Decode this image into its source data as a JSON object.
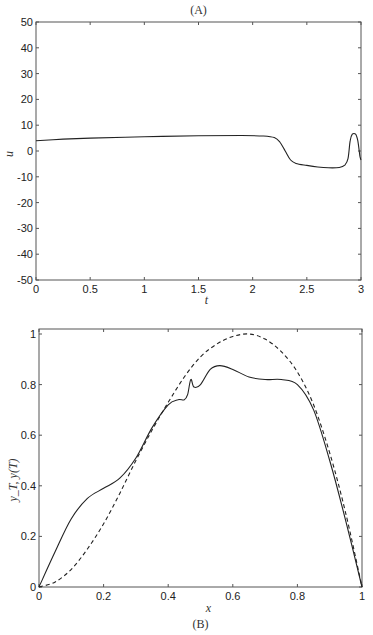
{
  "chart_data": [
    {
      "panel": "A",
      "type": "line",
      "title": "(A)",
      "xlabel": "t",
      "ylabel": "u",
      "xlim": [
        0,
        3
      ],
      "ylim": [
        -50,
        50
      ],
      "xticks": [
        0,
        0.5,
        1,
        1.5,
        2,
        2.5,
        3
      ],
      "xtick_labels": [
        "0",
        "0.5",
        "1",
        "1.5",
        "2",
        "2.5",
        "3"
      ],
      "yticks": [
        -50,
        -40,
        -30,
        -20,
        -10,
        0,
        10,
        20,
        30,
        40,
        50
      ],
      "ytick_labels": [
        "-50",
        "-40",
        "-30",
        "-20",
        "-10",
        "0",
        "10",
        "20",
        "30",
        "40",
        "50"
      ],
      "grid": false,
      "series": [
        {
          "name": "u(t)",
          "style": "solid",
          "x": [
            0,
            0.25,
            0.5,
            1.0,
            1.5,
            1.9,
            2.1,
            2.2,
            2.25,
            2.3,
            2.35,
            2.4,
            2.5,
            2.6,
            2.7,
            2.8,
            2.85,
            2.88,
            2.9,
            2.92,
            2.95,
            2.97,
            2.99,
            3.0
          ],
          "values": [
            4,
            4.6,
            5.0,
            5.5,
            5.9,
            6.0,
            5.8,
            5.2,
            3.5,
            0,
            -3.5,
            -4.8,
            -5.6,
            -6.2,
            -6.5,
            -6.4,
            -5.5,
            -3,
            4,
            6.5,
            6.5,
            4,
            -2,
            -3.5
          ]
        }
      ]
    },
    {
      "panel": "B",
      "type": "line",
      "title": "(B)",
      "xlabel": "x",
      "ylabel": "y_T, y(T)",
      "xlim": [
        0,
        1
      ],
      "ylim": [
        0,
        1
      ],
      "xticks": [
        0,
        0.2,
        0.4,
        0.6,
        0.8,
        1
      ],
      "xtick_labels": [
        "0",
        "0.2",
        "0.4",
        "0.6",
        "0.8",
        "1"
      ],
      "yticks": [
        0,
        0.2,
        0.4,
        0.6,
        0.8,
        1
      ],
      "ytick_labels": [
        "0",
        "0.2",
        "0.4",
        "0.6",
        "0.8",
        "1"
      ],
      "grid": false,
      "series": [
        {
          "name": "y(T)",
          "style": "solid",
          "x": [
            0,
            0.05,
            0.1,
            0.15,
            0.2,
            0.25,
            0.3,
            0.35,
            0.4,
            0.43,
            0.45,
            0.46,
            0.47,
            0.48,
            0.5,
            0.53,
            0.56,
            0.6,
            0.65,
            0.7,
            0.75,
            0.8,
            0.85,
            0.9,
            0.95,
            1.0
          ],
          "values": [
            0,
            0.14,
            0.27,
            0.35,
            0.39,
            0.43,
            0.51,
            0.63,
            0.72,
            0.74,
            0.74,
            0.76,
            0.82,
            0.79,
            0.8,
            0.86,
            0.875,
            0.86,
            0.83,
            0.82,
            0.82,
            0.8,
            0.7,
            0.5,
            0.26,
            0
          ]
        },
        {
          "name": "y_T",
          "style": "dashed",
          "x": [
            0,
            0.05,
            0.1,
            0.15,
            0.2,
            0.25,
            0.3,
            0.35,
            0.4,
            0.45,
            0.5,
            0.55,
            0.6,
            0.65,
            0.7,
            0.75,
            0.8,
            0.85,
            0.9,
            0.95,
            1.0
          ],
          "values": [
            0,
            0.02,
            0.07,
            0.15,
            0.25,
            0.37,
            0.5,
            0.62,
            0.73,
            0.83,
            0.91,
            0.96,
            0.99,
            1.0,
            0.98,
            0.93,
            0.85,
            0.72,
            0.53,
            0.29,
            0
          ]
        }
      ]
    }
  ]
}
